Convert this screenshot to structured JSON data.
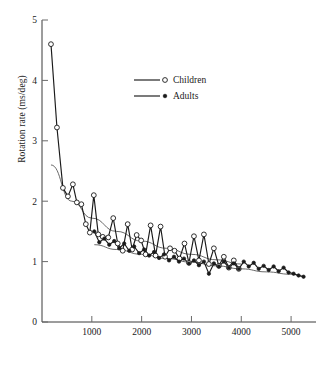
{
  "chart_data": {
    "type": "line",
    "title": "",
    "subtitle": "",
    "xlabel": "",
    "ylabel": "Rotation rate (ms/deg)",
    "xlim": [
      0,
      5500
    ],
    "ylim": [
      0,
      5
    ],
    "xticks": [
      1000,
      2000,
      3000,
      4000,
      5000
    ],
    "xtick_labels": [
      "1000",
      "2000",
      "3000",
      "4000",
      "5000"
    ],
    "yticks": [
      0,
      1,
      2,
      3,
      4,
      5
    ],
    "ytick_labels": [
      "0",
      "1",
      "2",
      "3",
      "4",
      "5"
    ],
    "grid": false,
    "legend_position": "top-center",
    "legend": [
      "Children",
      "Adults"
    ],
    "series": [
      {
        "name": "Children",
        "marker": "open-circle",
        "line": true,
        "points": [
          [
            180,
            4.6
          ],
          [
            300,
            3.22
          ],
          [
            420,
            2.22
          ],
          [
            520,
            2.08
          ],
          [
            620,
            2.28
          ],
          [
            700,
            1.98
          ],
          [
            790,
            1.95
          ],
          [
            880,
            1.62
          ],
          [
            960,
            1.48
          ],
          [
            1040,
            2.1
          ],
          [
            1130,
            1.45
          ],
          [
            1220,
            1.41
          ],
          [
            1330,
            1.4
          ],
          [
            1430,
            1.72
          ],
          [
            1520,
            1.3
          ],
          [
            1620,
            1.18
          ],
          [
            1720,
            1.62
          ],
          [
            1810,
            1.2
          ],
          [
            1900,
            1.44
          ],
          [
            1990,
            1.35
          ],
          [
            2080,
            1.12
          ],
          [
            2180,
            1.6
          ],
          [
            2280,
            1.1
          ],
          [
            2380,
            1.58
          ],
          [
            2470,
            1.08
          ],
          [
            2570,
            1.22
          ],
          [
            2660,
            1.18
          ],
          [
            2760,
            1.05
          ],
          [
            2860,
            1.3
          ],
          [
            2950,
            0.98
          ],
          [
            3050,
            1.42
          ],
          [
            3150,
            1.02
          ],
          [
            3250,
            1.45
          ],
          [
            3350,
            0.96
          ],
          [
            3450,
            1.22
          ],
          [
            3550,
            0.93
          ],
          [
            3650,
            1.08
          ],
          [
            3750,
            0.9
          ],
          [
            3850,
            1.02
          ],
          [
            3950,
            0.88
          ]
        ],
        "trend": [
          [
            180,
            2.6
          ],
          [
            600,
            2.0
          ],
          [
            1000,
            1.72
          ],
          [
            1500,
            1.5
          ],
          [
            2000,
            1.34
          ],
          [
            2500,
            1.22
          ],
          [
            3000,
            1.12
          ],
          [
            3500,
            1.03
          ],
          [
            4000,
            0.96
          ]
        ]
      },
      {
        "name": "Adults",
        "marker": "filled-circle",
        "line": true,
        "points": [
          [
            1050,
            1.5
          ],
          [
            1150,
            1.32
          ],
          [
            1250,
            1.38
          ],
          [
            1350,
            1.28
          ],
          [
            1450,
            1.34
          ],
          [
            1550,
            1.22
          ],
          [
            1650,
            1.3
          ],
          [
            1750,
            1.18
          ],
          [
            1850,
            1.25
          ],
          [
            1950,
            1.14
          ],
          [
            2050,
            1.2
          ],
          [
            2150,
            1.1
          ],
          [
            2250,
            1.16
          ],
          [
            2350,
            1.06
          ],
          [
            2450,
            1.12
          ],
          [
            2550,
            1.02
          ],
          [
            2650,
            1.08
          ],
          [
            2750,
            1.0
          ],
          [
            2850,
            1.05
          ],
          [
            2950,
            0.97
          ],
          [
            3050,
            1.02
          ],
          [
            3150,
            0.94
          ],
          [
            3250,
            1.0
          ],
          [
            3350,
            0.8
          ],
          [
            3450,
            0.97
          ],
          [
            3550,
            0.92
          ],
          [
            3650,
            1.0
          ],
          [
            3750,
            0.9
          ],
          [
            3850,
            0.97
          ],
          [
            3950,
            0.88
          ],
          [
            4050,
            1.0
          ],
          [
            4150,
            0.92
          ],
          [
            4250,
            0.98
          ],
          [
            4350,
            0.88
          ],
          [
            4450,
            0.93
          ],
          [
            4550,
            0.86
          ],
          [
            4650,
            0.92
          ],
          [
            4750,
            0.84
          ],
          [
            4850,
            0.9
          ],
          [
            4950,
            0.82
          ],
          [
            5050,
            0.8
          ],
          [
            5150,
            0.77
          ],
          [
            5250,
            0.75
          ]
        ],
        "trend": [
          [
            1050,
            1.28
          ],
          [
            1500,
            1.2
          ],
          [
            2000,
            1.12
          ],
          [
            2500,
            1.05
          ],
          [
            3000,
            0.99
          ],
          [
            3500,
            0.93
          ],
          [
            4000,
            0.88
          ],
          [
            4500,
            0.83
          ],
          [
            5000,
            0.79
          ],
          [
            5250,
            0.76
          ]
        ]
      }
    ]
  },
  "legend": {
    "items": [
      {
        "label": "Children",
        "marker": "open-circle"
      },
      {
        "label": "Adults",
        "marker": "filled-circle"
      }
    ]
  },
  "axes": {
    "ylabel": "Rotation rate (ms/deg)"
  }
}
